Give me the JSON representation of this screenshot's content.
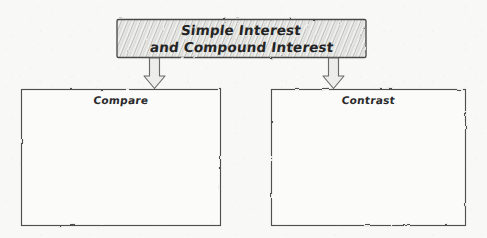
{
  "canvas": {
    "width": 487,
    "height": 238,
    "background_color": "#f8f8f6",
    "ink_color": "#3a3a3a",
    "title_fill_color": "#e8e8e6",
    "hatch_color": "#b9b9b5",
    "arrow_fill_color": "#ededeb"
  },
  "title_box": {
    "line1": "Simple Interest",
    "line2": "and Compound Interest",
    "style": "hatched-rounded-rectangle"
  },
  "arrows": [
    {
      "name": "arrow-to-compare",
      "direction": "down"
    },
    {
      "name": "arrow-to-contrast",
      "direction": "down"
    }
  ],
  "boxes": [
    {
      "id": "compare",
      "label": "Compare",
      "content": "",
      "style": "hand-drawn-rectangle"
    },
    {
      "id": "contrast",
      "label": "Contrast",
      "content": "",
      "style": "hand-drawn-rectangle"
    }
  ]
}
